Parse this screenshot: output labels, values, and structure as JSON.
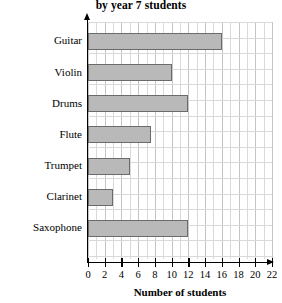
{
  "chart_data": {
    "type": "bar",
    "orientation": "horizontal",
    "title": "by year 7 students",
    "title_full_visible": "by year 7 students",
    "xlabel": "Number of students",
    "ylabel": "Musical instrument",
    "categories": [
      "Guitar",
      "Violin",
      "Drums",
      "Flute",
      "Trumpet",
      "Clarinet",
      "Saxophone"
    ],
    "values": [
      16,
      10,
      12,
      7.5,
      5,
      3,
      12
    ],
    "xlim": [
      0,
      22
    ],
    "xticks": [
      0,
      2,
      4,
      6,
      8,
      10,
      12,
      14,
      16,
      18,
      20,
      22
    ],
    "xtick_labels": [
      "0",
      "2",
      "4",
      "6",
      "8",
      "10",
      "12",
      "14",
      "16",
      "18",
      "20",
      "22"
    ],
    "grid": true,
    "grid_minor_step": 1,
    "legend": null,
    "bar_color": "#b9b9b9",
    "bar_edge_color": "#6b6b6b",
    "grid_color": "#d9d9d9",
    "axis_color": "#000000"
  }
}
